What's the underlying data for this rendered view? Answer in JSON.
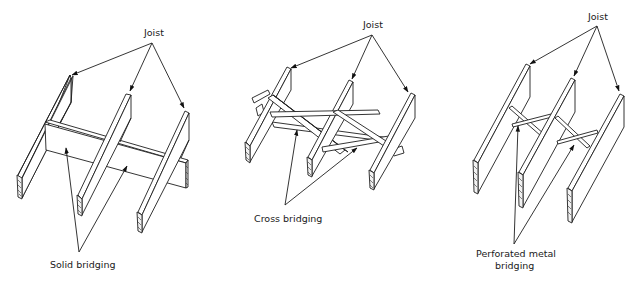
{
  "figure": {
    "panels": [
      {
        "id": "solid",
        "joist_label": "Joist",
        "bridging_label": "Solid bridging",
        "bridging_type": "solid"
      },
      {
        "id": "cross",
        "joist_label": "Joist",
        "bridging_label": "Cross bridging",
        "bridging_type": "cross"
      },
      {
        "id": "metal",
        "joist_label": "Joist",
        "bridging_label_line1": "Perforated metal",
        "bridging_label_line2": "bridging",
        "bridging_type": "perforated-metal"
      }
    ],
    "colors": {
      "background": "#ffffff",
      "ink": "#1e1e1e"
    }
  }
}
